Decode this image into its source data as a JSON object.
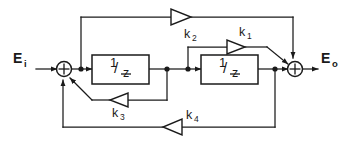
{
  "diagram": {
    "type": "block-diagram",
    "background_color": "#ffffff",
    "line_color": "#1a1a1a",
    "signals": {
      "input": {
        "base": "E",
        "subscript": "i",
        "full": "Ei"
      },
      "output": {
        "base": "E",
        "subscript": "o",
        "full": "Eo"
      }
    },
    "blocks": [
      {
        "id": "delay-1",
        "numerator": "1",
        "slash": "/",
        "denominator": "z",
        "full": "1/z"
      },
      {
        "id": "delay-2",
        "numerator": "1",
        "slash": "/",
        "denominator": "z",
        "full": "1/z"
      }
    ],
    "gains": [
      {
        "id": "k1",
        "base": "k",
        "subscript": "1",
        "full": "k1",
        "direction": "right",
        "path": "feedforward-inner"
      },
      {
        "id": "k2",
        "base": "k",
        "subscript": "2",
        "full": "k2",
        "direction": "right",
        "path": "feedforward-outer"
      },
      {
        "id": "k3",
        "base": "k",
        "subscript": "3",
        "full": "k3",
        "direction": "left",
        "path": "feedback-inner"
      },
      {
        "id": "k4",
        "base": "k",
        "subscript": "4",
        "full": "k4",
        "direction": "left",
        "path": "feedback-outer"
      }
    ],
    "summers": [
      {
        "id": "summer-left",
        "symbol": "+",
        "inputs": [
          "input",
          "k3",
          "k4"
        ]
      },
      {
        "id": "summer-right",
        "symbol": "+",
        "inputs": [
          "delay-2",
          "k1",
          "k2"
        ]
      }
    ]
  }
}
